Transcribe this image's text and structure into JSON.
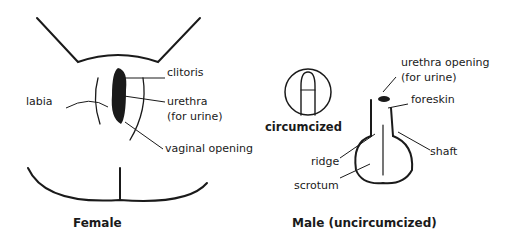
{
  "female": {
    "title": "Female",
    "labels": {
      "clitoris": "clitoris",
      "labia": "labia",
      "urethra_line1": "urethra",
      "urethra_line2": "(for urine)",
      "vaginal_opening": "vaginal opening"
    }
  },
  "male": {
    "title": "Male (uncircumcized)",
    "inset_label": "circumcized",
    "labels": {
      "urethra_opening_line1": "urethra opening",
      "urethra_opening_line2": "(for urine)",
      "foreskin": "foreskin",
      "shaft": "shaft",
      "ridge": "ridge",
      "scrotum": "scrotum"
    }
  }
}
